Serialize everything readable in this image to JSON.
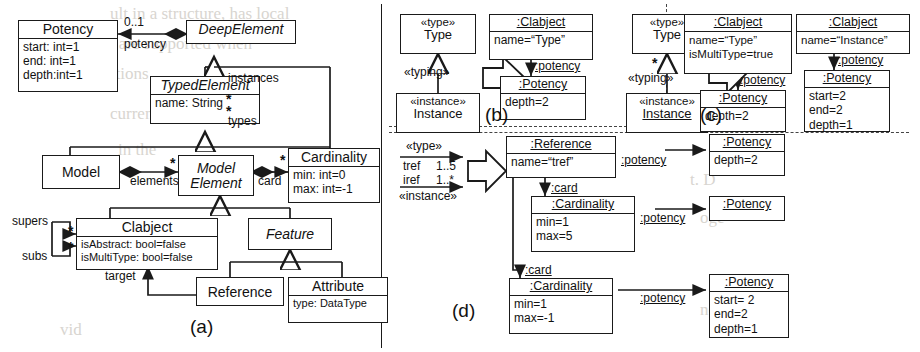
{
  "figure": {
    "kind": "uml-class-and-object-diagrams",
    "panels": [
      {
        "id": "a",
        "label": "(a)"
      },
      {
        "id": "b",
        "label": "(b)"
      },
      {
        "id": "c",
        "label": "(c)"
      },
      {
        "id": "d",
        "label": "(d)"
      }
    ]
  },
  "panel_a": {
    "classes": [
      {
        "name": "Potency",
        "abstract": false,
        "attributes": [
          "start: int=1",
          "end: int=1",
          "depth:int=1"
        ]
      },
      {
        "name": "DeepElement",
        "abstract": true,
        "attributes": []
      },
      {
        "name": "TypedElement",
        "abstract": true,
        "attributes": [
          "name: String"
        ]
      },
      {
        "name": "Model",
        "abstract": false,
        "attributes": []
      },
      {
        "name": "Model Element",
        "abstract": true,
        "attributes": [],
        "title_line1": "Model",
        "title_line2": "Element"
      },
      {
        "name": "Cardinality",
        "abstract": false,
        "attributes": [
          "min: int=0",
          "max: int=-1"
        ]
      },
      {
        "name": "Clabject",
        "abstract": false,
        "attributes": [
          "isAbstract: bool=false",
          "isMultiType: bool=false"
        ]
      },
      {
        "name": "Feature",
        "abstract": true,
        "attributes": []
      },
      {
        "name": "Reference",
        "abstract": false,
        "attributes": []
      },
      {
        "name": "Attribute",
        "abstract": false,
        "attributes": [
          "type: DataType"
        ]
      }
    ],
    "association_labels": [
      {
        "text": "0..1"
      },
      {
        "text": "potency"
      },
      {
        "text": "instances"
      },
      {
        "text": "types"
      },
      {
        "text": "elements"
      },
      {
        "text": "card"
      },
      {
        "text": "supers"
      },
      {
        "text": "subs"
      },
      {
        "text": "target"
      },
      {
        "text": "*"
      }
    ]
  },
  "panel_b": {
    "label": "(b)",
    "source": {
      "type_box": {
        "stereotype": "«type»",
        "name": "Type"
      },
      "instance_box": {
        "stereotype": "«instance»",
        "name": "Instance"
      },
      "link_label": "«typing»"
    },
    "target": {
      "clabject": {
        "title": ":Clabject",
        "attributes": [
          "name=“Type”"
        ]
      },
      "potency": {
        "title": ":Potency",
        "attributes": [
          "depth=2"
        ]
      },
      "link_label": ":potency"
    }
  },
  "panel_c": {
    "label": "(c)",
    "source": {
      "type_box": {
        "stereotype": "«type»",
        "name": "Type"
      },
      "instance_box": {
        "stereotype": "«instance»",
        "name": "Instance"
      },
      "link_label": "«typing»",
      "multiplicity": "*"
    },
    "target": {
      "clabject_type": {
        "title": ":Clabject",
        "attributes": [
          "name=“Type”",
          "isMultiType=true"
        ]
      },
      "potency_type": {
        "title": ":Potency",
        "attributes": [
          "depth=2"
        ]
      },
      "clabject_instance": {
        "title": ":Clabject",
        "attributes": [
          "name=“Instance”"
        ]
      },
      "potency_instance": {
        "title": ":Potency",
        "attributes": [
          "start=2",
          "end=2",
          "depth=1"
        ]
      },
      "link_label": ":potency"
    }
  },
  "panel_d": {
    "label": "(d)",
    "source": {
      "type_stereotype": "«type»",
      "instance_stereotype": "«instance»",
      "type_ref": "tref",
      "type_mult": "1..5",
      "instance_ref": "iref",
      "instance_mult": "1..*"
    },
    "target": {
      "reference": {
        "title": ":Reference",
        "attributes": [
          "name=“tref”"
        ]
      },
      "cardinality_top": {
        "title": ":Cardinality",
        "attributes": [
          "min=1",
          "max=5"
        ]
      },
      "cardinality_bottom": {
        "title": ":Cardinality",
        "attributes": [
          "min=1",
          "max=-1"
        ]
      },
      "potency_reference": {
        "title": ":Potency",
        "attributes": [
          "depth=2"
        ]
      },
      "potency_cardinality_top": {
        "title": ":Potency",
        "attributes": []
      },
      "potency_cardinality_bottom": {
        "title": ":Potency",
        "attributes": [
          "start= 2",
          "end=2",
          "depth=1"
        ]
      },
      "link_label_potency": ":potency",
      "link_label_card": ":card"
    }
  },
  "colors": {
    "line": "#1a1a1a",
    "background": "#ffffff",
    "ghost_text": "#d8d5d0"
  }
}
